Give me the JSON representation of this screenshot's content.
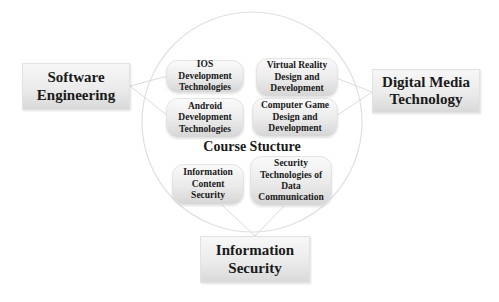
{
  "diagram": {
    "center": {
      "title": "Course Stucture",
      "nodes": [
        {
          "id": "ios",
          "label": "IOS Development Technologies"
        },
        {
          "id": "vr",
          "label": "Virtual Reality Design and Development"
        },
        {
          "id": "android",
          "label": "Android Development Technologies"
        },
        {
          "id": "game",
          "label": "Computer Game Design and Development"
        },
        {
          "id": "info-content",
          "label": "Information Content Security"
        },
        {
          "id": "sec-tech",
          "label": "Security Technologies of Data Communication"
        }
      ]
    },
    "outer": [
      {
        "id": "software-engineering",
        "label": "Software Engineering",
        "connects": [
          "ios",
          "android"
        ]
      },
      {
        "id": "digital-media",
        "label": "Digital Media Technology",
        "connects": [
          "vr",
          "game"
        ]
      },
      {
        "id": "information-security",
        "label": "Information Security",
        "connects": [
          "info-content",
          "sec-tech"
        ]
      }
    ],
    "colors": {
      "line": "#dcdcdc",
      "box_light": "#f7f7f7",
      "box_dark": "#d9d9d9",
      "text": "#1a1a1a"
    }
  }
}
